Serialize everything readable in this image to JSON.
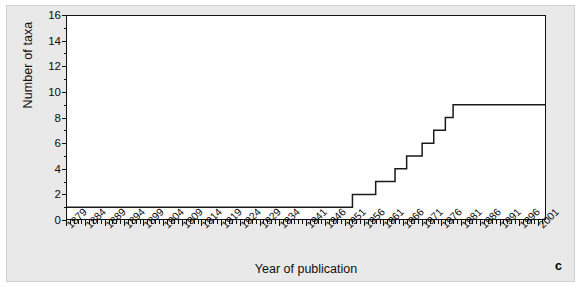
{
  "figure": {
    "panel_label": "c",
    "background_color": "#e9e9e9",
    "plot_background_color": "#ffffff",
    "line_color": "#1a1a1a"
  },
  "chart_data": {
    "type": "line",
    "title": "",
    "subtitle": "",
    "xlabel": "Year of publication",
    "ylabel": "Number of taxa",
    "xlim": [
      1879,
      2003
    ],
    "ylim": [
      0,
      16
    ],
    "grid": false,
    "legend": null,
    "step": true,
    "annotations": [
      "c"
    ],
    "ytick_labels": [
      "0",
      "2",
      "4",
      "6",
      "8",
      "10",
      "12",
      "14",
      "16"
    ],
    "ytick_values": [
      0,
      2,
      4,
      6,
      8,
      10,
      12,
      14,
      16
    ],
    "ytick_minor_step": 1,
    "xtick_labels": [
      "1879",
      "1884",
      "1889",
      "1894",
      "1899",
      "1904",
      "1909",
      "1914",
      "1919",
      "1924",
      "1929",
      "1934",
      "1941",
      "1946",
      "1951",
      "1956",
      "1961",
      "1966",
      "1971",
      "1976",
      "1981",
      "1986",
      "1991",
      "1996",
      "2001"
    ],
    "xtick_values": [
      1879,
      1884,
      1889,
      1894,
      1899,
      1904,
      1909,
      1914,
      1919,
      1924,
      1929,
      1934,
      1941,
      1946,
      1951,
      1956,
      1961,
      1966,
      1971,
      1976,
      1981,
      1986,
      1991,
      1996,
      2001
    ],
    "xtick_minor_step": 1,
    "series": [
      {
        "name": "Cumulative number of taxa",
        "x": [
          1879,
          1953,
          1953,
          1959,
          1959,
          1964,
          1964,
          1967,
          1967,
          1971,
          1971,
          1974,
          1974,
          1977,
          1977,
          1979,
          1979,
          2003
        ],
        "values": [
          1,
          1,
          2,
          2,
          3,
          3,
          4,
          4,
          5,
          5,
          6,
          6,
          7,
          7,
          8,
          8,
          9,
          9
        ]
      }
    ]
  }
}
